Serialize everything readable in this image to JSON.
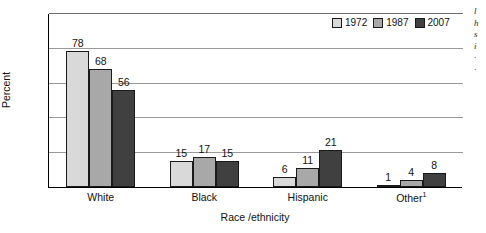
{
  "chart_data": {
    "type": "bar",
    "title": "",
    "xlabel": "Race /ethnicity",
    "ylabel": "Percent",
    "ylim": [
      0,
      100
    ],
    "yticks": [
      0,
      20,
      40,
      60,
      80,
      100
    ],
    "grid": true,
    "legend_position": "top-right",
    "categories": [
      "White",
      "Black",
      "Hispanic",
      "Other"
    ],
    "category_footnotes": [
      "",
      "",
      "",
      "1"
    ],
    "series": [
      {
        "name": "1972",
        "color": "#d9d9d9",
        "values": [
          78,
          15,
          6,
          1
        ]
      },
      {
        "name": "1987",
        "color": "#a8a8a8",
        "values": [
          68,
          17,
          11,
          4
        ]
      },
      {
        "name": "2007",
        "color": "#404040",
        "values": [
          56,
          15,
          21,
          8
        ]
      }
    ]
  },
  "axis": {
    "y_label": "Percent",
    "x_label": "Race /ethnicity",
    "y_ticks": [
      "100",
      "80",
      "60",
      "40",
      "20",
      "0"
    ]
  },
  "legend": {
    "items": [
      {
        "label": "1972",
        "color": "#d9d9d9"
      },
      {
        "label": "1987",
        "color": "#a8a8a8"
      },
      {
        "label": "2007",
        "color": "#404040"
      }
    ]
  },
  "categories": [
    {
      "label": "White",
      "footnote": "",
      "values": [
        "78",
        "68",
        "56"
      ]
    },
    {
      "label": "Black",
      "footnote": "",
      "values": [
        "15",
        "17",
        "15"
      ]
    },
    {
      "label": "Hispanic",
      "footnote": "",
      "values": [
        "6",
        "11",
        "21"
      ]
    },
    {
      "label": "Other",
      "footnote": "1",
      "values": [
        "1",
        "4",
        "8"
      ]
    }
  ],
  "margin_text": {
    "sliver": "l\nl\nh\ns\ni\n·\n·"
  }
}
